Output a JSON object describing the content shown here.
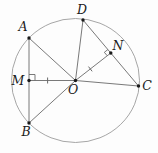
{
  "figure": {
    "colors": {
      "background": "#fdfdfd",
      "segment_stroke": "#6a6a6a",
      "circle_stroke": "#9c9c9c",
      "point_fill": "#1a1a1a",
      "label_color": "#1a1a1a"
    },
    "circle": {
      "cx": 75.5,
      "cy": 80.5,
      "rx": 64,
      "ry": 62
    },
    "points": [
      {
        "id": "A",
        "label": "A",
        "x": 29,
        "y": 38,
        "label_x": 23,
        "label_y": 31
      },
      {
        "id": "B",
        "label": "B",
        "x": 29,
        "y": 123,
        "label_x": 26,
        "label_y": 136
      },
      {
        "id": "C",
        "label": "C",
        "x": 138.5,
        "y": 86,
        "label_x": 147,
        "label_y": 90
      },
      {
        "id": "D",
        "label": "D",
        "x": 83,
        "y": 20,
        "label_x": 82,
        "label_y": 14
      },
      {
        "id": "M",
        "label": "M",
        "x": 29,
        "y": 80.5,
        "label_x": 18,
        "label_y": 85
      },
      {
        "id": "N",
        "label": "N",
        "x": 110.8,
        "y": 53,
        "label_x": 118,
        "label_y": 50
      },
      {
        "id": "O",
        "label": "O",
        "x": 75.5,
        "y": 80.5,
        "label_x": 73,
        "label_y": 94
      }
    ],
    "segments": [
      {
        "from": "A",
        "to": "B"
      },
      {
        "from": "A",
        "to": "O"
      },
      {
        "from": "B",
        "to": "O"
      },
      {
        "from": "D",
        "to": "O"
      },
      {
        "from": "D",
        "to": "C"
      },
      {
        "from": "O",
        "to": "C"
      },
      {
        "from": "O",
        "to": "M"
      },
      {
        "from": "O",
        "to": "N"
      }
    ],
    "tick_marks": [
      {
        "from": "M",
        "to": "O",
        "t": 0.4,
        "half_len": 3
      },
      {
        "from": "O",
        "to": "N",
        "t": 0.42,
        "half_len": 3
      }
    ],
    "right_angle_marks": [
      {
        "at": "M",
        "toward1": "O",
        "toward2": "A",
        "size": 6
      },
      {
        "at": "N",
        "toward1": "O",
        "toward2": "D",
        "size": 4.5
      }
    ],
    "dot_radius": 1.7
  }
}
